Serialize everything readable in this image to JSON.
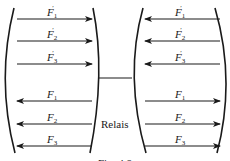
{
  "diagram": {
    "colors": {
      "ink": "#1a1a1a",
      "background": "#ffffff"
    },
    "left_group": {
      "arrows": [
        {
          "label": "F",
          "sub": "1",
          "prime": true,
          "y": 19,
          "direction": "right"
        },
        {
          "label": "F",
          "sub": "2",
          "prime": true,
          "y": 41,
          "direction": "right"
        },
        {
          "label": "F",
          "sub": "3",
          "prime": true,
          "y": 64,
          "direction": "right"
        },
        {
          "label": "F",
          "sub": "1",
          "prime": false,
          "y": 101,
          "direction": "left"
        },
        {
          "label": "F",
          "sub": "2",
          "prime": false,
          "y": 124,
          "direction": "left"
        },
        {
          "label": "F",
          "sub": "3",
          "prime": false,
          "y": 146,
          "direction": "left"
        }
      ]
    },
    "right_group": {
      "arrows": [
        {
          "label": "F",
          "sub": "1",
          "prime": true,
          "y": 19,
          "direction": "left"
        },
        {
          "label": "F",
          "sub": "2",
          "prime": true,
          "y": 41,
          "direction": "left"
        },
        {
          "label": "F",
          "sub": "3",
          "prime": true,
          "y": 64,
          "direction": "left"
        },
        {
          "label": "F",
          "sub": "1",
          "prime": false,
          "y": 101,
          "direction": "right"
        },
        {
          "label": "F",
          "sub": "2",
          "prime": false,
          "y": 124,
          "direction": "right"
        },
        {
          "label": "F",
          "sub": "3",
          "prime": false,
          "y": 146,
          "direction": "right"
        }
      ]
    },
    "connector_label": "Relais",
    "caption": "Fig. 4.8"
  }
}
